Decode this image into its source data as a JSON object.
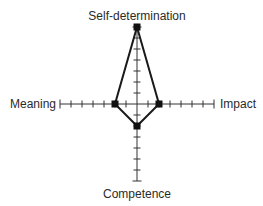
{
  "diagram": {
    "type": "radar-star",
    "axes": [
      {
        "name": "Self-determination",
        "direction": "up",
        "value": 7
      },
      {
        "name": "Impact",
        "direction": "right",
        "value": 2
      },
      {
        "name": "Competence",
        "direction": "down",
        "value": 2
      },
      {
        "name": "Meaning",
        "direction": "left",
        "value": 2
      }
    ],
    "axis_max": 7,
    "labels": {
      "top": "Self-determination",
      "right": "Impact",
      "bottom": "Competence",
      "left": "Meaning"
    },
    "colors": {
      "line": "#1a1a1a",
      "axis": "#333333",
      "marker": "#111111",
      "text": "#2a2a2a",
      "background": "#ffffff"
    }
  }
}
